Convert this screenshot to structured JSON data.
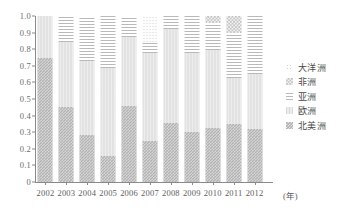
{
  "chart_data": {
    "type": "bar",
    "stacked": true,
    "normalized": true,
    "title": "",
    "subtitle": "",
    "xlabel": "(年)",
    "ylabel": "",
    "ylim": [
      0,
      1.0
    ],
    "grid": false,
    "legend_position": "right",
    "categories": [
      "2002",
      "2003",
      "2004",
      "2005",
      "2006",
      "2007",
      "2008",
      "2009",
      "2010",
      "2011",
      "2012"
    ],
    "ytick_labels": [
      "1.0",
      "0.9",
      "0.8",
      "0.7",
      "0.6",
      "0.5",
      "0.4",
      "0.3",
      "0.2",
      "0.1",
      "0"
    ],
    "ytick_values": [
      1.0,
      0.9,
      0.8,
      0.7,
      0.6,
      0.5,
      0.4,
      0.3,
      0.2,
      0.1,
      0
    ],
    "stack_order_bottom_to_top": [
      "北美洲",
      "欧洲",
      "亚洲",
      "非洲",
      "大洋洲"
    ],
    "series": [
      {
        "name": "北美洲",
        "pattern": "p-namerica",
        "color": "#b2b2b2",
        "values": [
          0.75,
          0.45,
          0.285,
          0.155,
          0.455,
          0.25,
          0.355,
          0.3,
          0.325,
          0.35,
          0.32
        ]
      },
      {
        "name": "欧洲",
        "pattern": "p-europe",
        "color": "#ededed",
        "values": [
          0.25,
          0.395,
          0.445,
          0.53,
          0.42,
          0.525,
          0.565,
          0.48,
          0.47,
          0.275,
          0.33
        ]
      },
      {
        "name": "亚洲",
        "pattern": "p-asia",
        "color": "#fbfbfb",
        "values": [
          0.0,
          0.155,
          0.27,
          0.315,
          0.125,
          0.06,
          0.08,
          0.22,
          0.165,
          0.27,
          0.35
        ]
      },
      {
        "name": "非洲",
        "pattern": "p-africa",
        "color": "#f2f2f2",
        "values": [
          0.0,
          0.0,
          0.0,
          0.0,
          0.0,
          0.0,
          0.0,
          0.0,
          0.04,
          0.105,
          0.0
        ]
      },
      {
        "name": "大洋洲",
        "pattern": "p-oceania",
        "color": "#fdfdfd",
        "values": [
          0.0,
          0.0,
          0.0,
          0.0,
          0.0,
          0.165,
          0.0,
          0.0,
          0.0,
          0.0,
          0.0
        ]
      }
    ]
  },
  "legend": {
    "items": [
      {
        "label": "大洋洲",
        "pattern": "p-oceania"
      },
      {
        "label": "非洲",
        "pattern": "p-africa"
      },
      {
        "label": "亚洲",
        "pattern": "p-asia"
      },
      {
        "label": "欧洲",
        "pattern": "p-europe"
      },
      {
        "label": "北美洲",
        "pattern": "p-namerica"
      }
    ]
  }
}
